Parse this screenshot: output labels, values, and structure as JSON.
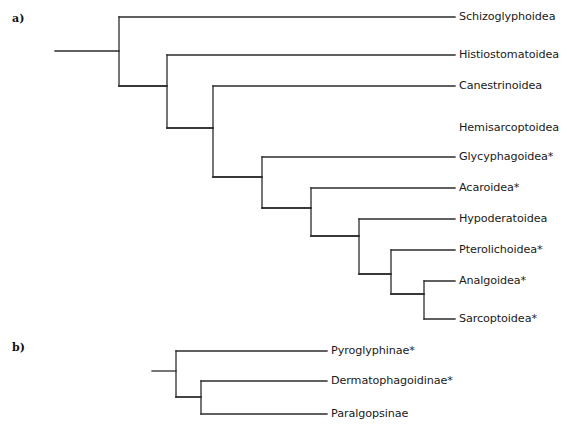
{
  "figure": {
    "type": "cladogram",
    "panels": [
      {
        "id": "a",
        "panel_label": "a)",
        "taxa": [
          {
            "label": "Schizoglyphoidea",
            "starred": false,
            "tip_y": 17,
            "tip_x_end": 455,
            "label_x": 459
          },
          {
            "label": "Histiostomatoidea",
            "starred": false,
            "tip_y": 55,
            "tip_x_end": 455,
            "label_x": 459
          },
          {
            "label": "Canestrinoidea",
            "starred": false,
            "tip_y": 86,
            "tip_x_end": 455,
            "label_x": 459
          },
          {
            "label": "Hemisarcoptoidea",
            "starred": false,
            "tip_y": 128,
            "tip_x_end": 455,
            "label_x": 459
          },
          {
            "label": "Glycyphagoidea*",
            "starred": true,
            "tip_y": 157,
            "tip_x_end": 455,
            "label_x": 459
          },
          {
            "label": "Acaroidea*",
            "starred": true,
            "tip_y": 188,
            "tip_x_end": 455,
            "label_x": 459
          },
          {
            "label": "Hypoderatoidea",
            "starred": false,
            "tip_y": 219,
            "tip_x_end": 455,
            "label_x": 459
          },
          {
            "label": "Pterolichoidea*",
            "starred": true,
            "tip_y": 250,
            "tip_x_end": 455,
            "label_x": 459
          },
          {
            "label": "Analgoidea*",
            "starred": true,
            "tip_y": 281,
            "tip_x_end": 455,
            "label_x": 459
          },
          {
            "label": "Sarcoptoidea*",
            "starred": true,
            "tip_y": 319,
            "tip_x_end": 455,
            "label_x": 459
          }
        ],
        "root_stem": {
          "x1": 55,
          "x2": 119,
          "y": 51
        },
        "nodes": [
          {
            "name": "node-1",
            "x": 119,
            "y_top": 17,
            "y_bottom": 86,
            "child_x_top": 455,
            "child_x_bottom": 167
          },
          {
            "name": "node-2",
            "x": 167,
            "y_top": 55,
            "y_bottom": 128,
            "child_x_top": 455,
            "child_x_bottom": 213
          },
          {
            "name": "node-3",
            "x": 213,
            "y_top": 86,
            "y_bottom": 177,
            "child_x_top": 455,
            "child_x_bottom": 262
          },
          {
            "name": "node-4",
            "x": 262,
            "y_top": 157,
            "y_bottom": 208,
            "child_x_top": 455,
            "child_x_bottom": 311
          },
          {
            "name": "node-5",
            "x": 311,
            "y_top": 188,
            "y_bottom": 236,
            "child_x_top": 455,
            "child_x_bottom": 359
          },
          {
            "name": "node-6",
            "x": 359,
            "y_top": 219,
            "y_bottom": 274,
            "child_x_top": 455,
            "child_x_bottom": 391
          },
          {
            "name": "node-7",
            "x": 391,
            "y_top": 250,
            "y_bottom": 294,
            "child_x_top": 455,
            "child_x_bottom": 424
          },
          {
            "name": "node-8",
            "x": 424,
            "y_top": 281,
            "y_bottom": 319,
            "child_x_top": 455,
            "child_x_bottom": 455
          }
        ],
        "internal_stems": [
          {
            "name": "stem-to-node-2",
            "x1": 119,
            "x2": 167,
            "y": 86
          },
          {
            "name": "stem-to-node-3",
            "x1": 167,
            "x2": 213,
            "y": 128
          },
          {
            "name": "stem-to-node-4",
            "x1": 213,
            "x2": 262,
            "y": 177
          },
          {
            "name": "stem-to-node-5",
            "x1": 262,
            "x2": 311,
            "y": 208
          },
          {
            "name": "stem-to-node-6",
            "x1": 311,
            "x2": 359,
            "y": 236
          },
          {
            "name": "stem-to-node-7",
            "x1": 359,
            "x2": 391,
            "y": 274
          },
          {
            "name": "stem-to-node-8",
            "x1": 391,
            "x2": 424,
            "y": 294
          }
        ]
      },
      {
        "id": "b",
        "panel_label": "b)",
        "taxa": [
          {
            "label": "Pyroglyphinae*",
            "starred": true,
            "tip_y": 351,
            "tip_x_end": 327,
            "label_x": 331
          },
          {
            "label": "Dermatophagoidinae*",
            "starred": true,
            "tip_y": 381,
            "tip_x_end": 327,
            "label_x": 331
          },
          {
            "label": "Paralgopsinae",
            "starred": false,
            "tip_y": 414,
            "tip_x_end": 327,
            "label_x": 331
          }
        ],
        "root_stem": {
          "x1": 152,
          "x2": 176,
          "y": 371
        },
        "nodes": [
          {
            "name": "node-b1",
            "x": 176,
            "y_top": 351,
            "y_bottom": 397,
            "child_x_top": 327,
            "child_x_bottom": 201
          },
          {
            "name": "node-b2",
            "x": 201,
            "y_top": 381,
            "y_bottom": 414,
            "child_x_top": 327,
            "child_x_bottom": 327
          }
        ],
        "internal_stems": [
          {
            "name": "stem-to-node-b2",
            "x1": 176,
            "x2": 201,
            "y": 397
          }
        ]
      }
    ],
    "style": {
      "branch_color": "#2b2b2b",
      "text_color": "#1a1a1a",
      "background": "#ffffff",
      "branch_width": 1.3
    }
  }
}
